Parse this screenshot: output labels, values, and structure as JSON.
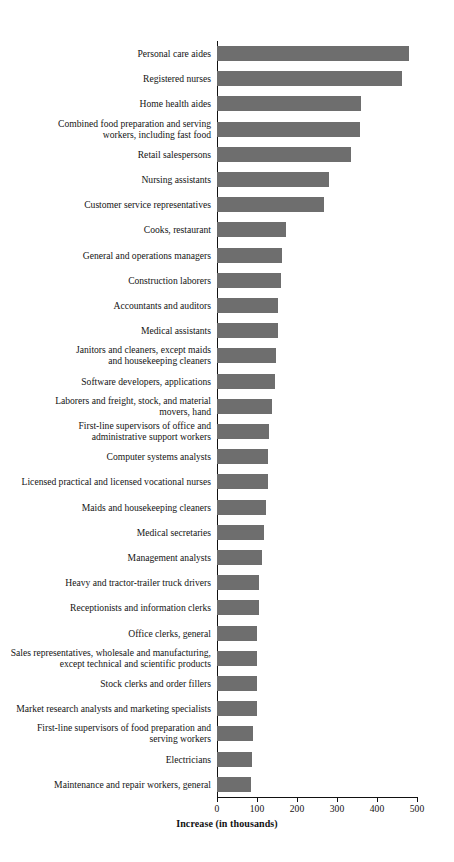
{
  "chart_data": {
    "type": "bar",
    "orientation": "horizontal",
    "title": "",
    "xlabel": "Increase (in thousands)",
    "ylabel": "",
    "xlim": [
      0,
      500
    ],
    "xticks": [
      0,
      100,
      200,
      300,
      400,
      500
    ],
    "xtick_labels": [
      "0",
      "100",
      "200",
      "300",
      "400",
      "500"
    ],
    "grid": false,
    "legend": null,
    "bar_color": "#6e6e6e",
    "axis_color": "#111111",
    "categories": [
      "Personal care aides",
      "Registered nurses",
      "Home health aides",
      "Combined food preparation and serving\nworkers, including fast food",
      "Retail salespersons",
      "Nursing assistants",
      "Customer service representatives",
      "Cooks, restaurant",
      "General and operations managers",
      "Construction laborers",
      "Accountants and auditors",
      "Medical assistants",
      "Janitors and cleaners, except maids\nand housekeeping cleaners",
      "Software developers, applications",
      "Laborers and freight, stock, and material\nmovers, hand",
      "First-line supervisors of office and\nadministrative support workers",
      "Computer systems analysts",
      "Licensed practical and licensed vocational nurses",
      "Maids and housekeeping cleaners",
      "Medical secretaries",
      "Management analysts",
      "Heavy and tractor-trailer truck drivers",
      "Receptionists and information clerks",
      "Office clerks, general",
      "Sales representatives, wholesale and manufacturing,\nexcept technical and scientific products",
      "Stock clerks and order fillers",
      "Market research analysts and marketing specialists",
      "First-line supervisors of food preparation and\nserving workers",
      "Electricians",
      "Maintenance and repair workers, general"
    ],
    "values": [
      480,
      462,
      361,
      357,
      334,
      280,
      268,
      172,
      163,
      160,
      153,
      152,
      148,
      146,
      137,
      130,
      128,
      127,
      122,
      118,
      112,
      106,
      106,
      99,
      101,
      99,
      99,
      91,
      88,
      84
    ]
  }
}
